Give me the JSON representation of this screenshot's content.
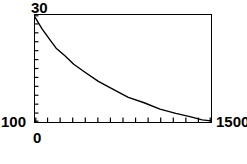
{
  "chart_data": {
    "type": "line",
    "title": "",
    "subtitle": "",
    "xlabel": "",
    "ylabel": "",
    "xlim": [
      0,
      1500
    ],
    "ylim": [
      100,
      30
    ],
    "y_axis_inverted": true,
    "grid": false,
    "legend": null,
    "axis_labels": {
      "y_top": "30",
      "y_bottom": "100",
      "x_left": "0",
      "x_right": "1500"
    },
    "tick_counts": {
      "x_ticks": 14,
      "y_ticks": 12
    },
    "series": [
      {
        "name": "decay-curve",
        "color": "#000000",
        "x": [
          0,
          60,
          120,
          180,
          255,
          420,
          555,
          675,
          795,
          930,
          1080,
          1200,
          1320,
          1425,
          1500
        ],
        "y": [
          32,
          40,
          46,
          51,
          57,
          66,
          71,
          76,
          80,
          85,
          89,
          92,
          95,
          97,
          99
        ]
      }
    ],
    "curve_points_normalized": [
      [
        0.0,
        0.02
      ],
      [
        0.04,
        0.13
      ],
      [
        0.08,
        0.22
      ],
      [
        0.12,
        0.31
      ],
      [
        0.17,
        0.38
      ],
      [
        0.22,
        0.46
      ],
      [
        0.28,
        0.53
      ],
      [
        0.36,
        0.62
      ],
      [
        0.45,
        0.7
      ],
      [
        0.53,
        0.77
      ],
      [
        0.62,
        0.82
      ],
      [
        0.71,
        0.88
      ],
      [
        0.8,
        0.92
      ],
      [
        0.88,
        0.95
      ],
      [
        0.95,
        0.98
      ],
      [
        1.0,
        0.99
      ]
    ]
  }
}
